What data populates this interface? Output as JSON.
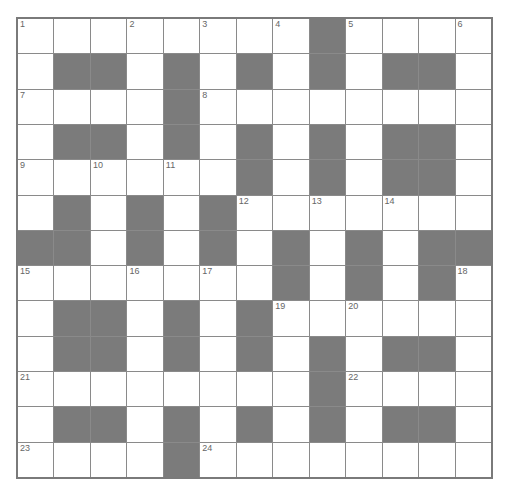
{
  "puzzle": {
    "rows": 13,
    "cols": 13,
    "colors": {
      "block": "#7b7b7b",
      "cell": "#ffffff",
      "line": "#8a8a8a"
    },
    "grid": [
      "WWWWWWWWBWWWW",
      "WBBWBWBWBWBBW",
      "WWWWBWWWWWWWW",
      "WBBWBWBWBWBBW",
      "WWWWWWBWBWBBW",
      "WBWBWBWWWWWWW",
      "BBWBWBWBWBWBB",
      "WWWWWWWBWBWBW",
      "WBBWBWBWWWWWW",
      "WBBWBWBWBWBBW",
      "WWWWWWWWBWWWW",
      "WBBWBWBWBWBBW",
      "WWWWBWWWWWWWW"
    ],
    "numbers": [
      {
        "r": 0,
        "c": 0,
        "n": "1"
      },
      {
        "r": 0,
        "c": 3,
        "n": "2"
      },
      {
        "r": 0,
        "c": 5,
        "n": "3"
      },
      {
        "r": 0,
        "c": 7,
        "n": "4"
      },
      {
        "r": 0,
        "c": 9,
        "n": "5"
      },
      {
        "r": 0,
        "c": 12,
        "n": "6"
      },
      {
        "r": 2,
        "c": 0,
        "n": "7"
      },
      {
        "r": 2,
        "c": 5,
        "n": "8"
      },
      {
        "r": 4,
        "c": 0,
        "n": "9"
      },
      {
        "r": 4,
        "c": 2,
        "n": "10"
      },
      {
        "r": 4,
        "c": 4,
        "n": "11"
      },
      {
        "r": 5,
        "c": 6,
        "n": "12"
      },
      {
        "r": 5,
        "c": 8,
        "n": "13"
      },
      {
        "r": 5,
        "c": 10,
        "n": "14"
      },
      {
        "r": 7,
        "c": 0,
        "n": "15"
      },
      {
        "r": 7,
        "c": 3,
        "n": "16"
      },
      {
        "r": 7,
        "c": 5,
        "n": "17"
      },
      {
        "r": 7,
        "c": 12,
        "n": "18"
      },
      {
        "r": 8,
        "c": 7,
        "n": "19"
      },
      {
        "r": 8,
        "c": 9,
        "n": "20"
      },
      {
        "r": 10,
        "c": 0,
        "n": "21"
      },
      {
        "r": 10,
        "c": 9,
        "n": "22"
      },
      {
        "r": 12,
        "c": 0,
        "n": "23"
      },
      {
        "r": 12,
        "c": 5,
        "n": "24"
      }
    ]
  }
}
